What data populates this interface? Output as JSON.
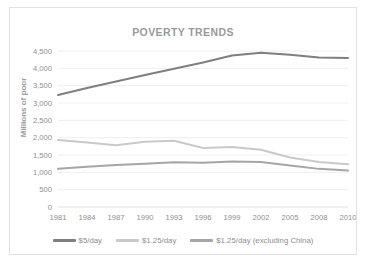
{
  "chart_data": {
    "type": "line",
    "title": "POVERTY TRENDS",
    "xlabel": "",
    "ylabel": "Millions of poor",
    "x": [
      1981,
      1984,
      1987,
      1990,
      1993,
      1996,
      1999,
      2002,
      2005,
      2008,
      2010
    ],
    "xticklabels": [
      "1981",
      "1984",
      "1987",
      "1990",
      "1993",
      "1996",
      "1999",
      "2002",
      "2005",
      "2008",
      "2010"
    ],
    "yticklabels": [
      "4,500",
      "4,000",
      "3,500",
      "3,000",
      "2,500",
      "2,000",
      "1,500",
      "1,000",
      "500",
      "0"
    ],
    "ylim": [
      0,
      4500
    ],
    "ytick_step": 500,
    "grid": true,
    "legend_position": "bottom",
    "series": [
      {
        "name": "$5/day",
        "color": "#7f7f7f",
        "width": 2.0,
        "values": [
          3230,
          3430,
          3620,
          3810,
          3990,
          4170,
          4370,
          4450,
          4390,
          4310,
          4300
        ]
      },
      {
        "name": "$1.25/day",
        "color": "#c9c9c9",
        "width": 2.0,
        "values": [
          1930,
          1860,
          1780,
          1880,
          1910,
          1700,
          1730,
          1650,
          1430,
          1300,
          1230
        ]
      },
      {
        "name": "$1.25/day (excluding China)",
        "color": "#a6a6a6",
        "width": 2.0,
        "values": [
          1100,
          1160,
          1210,
          1250,
          1290,
          1280,
          1310,
          1300,
          1200,
          1100,
          1050
        ]
      }
    ]
  },
  "legend": [
    {
      "label": "$5/day",
      "color": "#7f7f7f"
    },
    {
      "label": "$1.25/day",
      "color": "#c9c9c9"
    },
    {
      "label": "$1.25/day (excluding China)",
      "color": "#a6a6a6"
    }
  ]
}
